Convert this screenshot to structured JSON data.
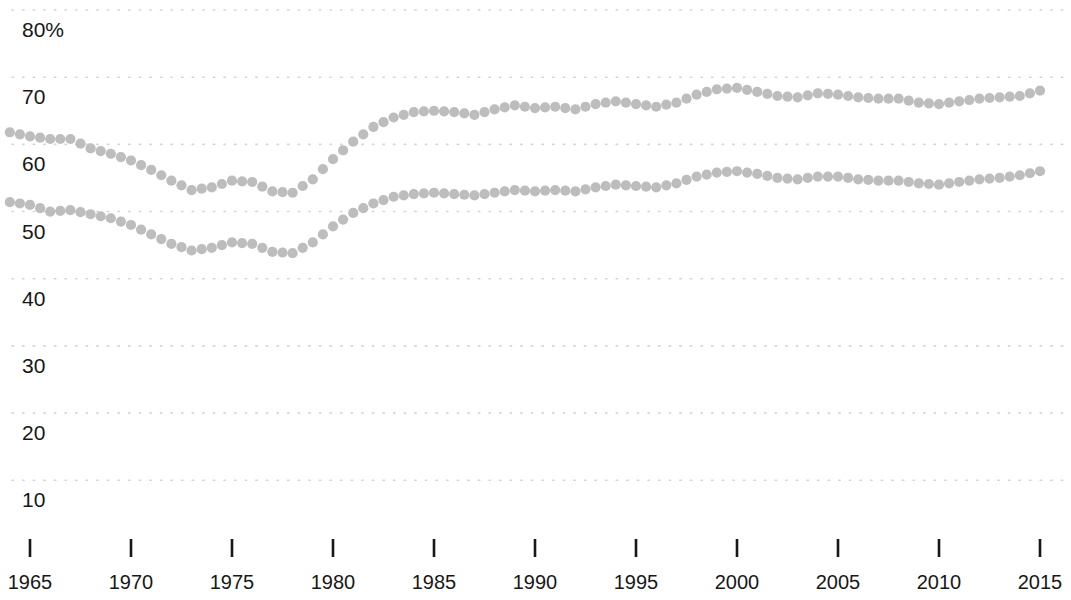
{
  "chart_data": {
    "type": "line",
    "title": "",
    "subtitle": "",
    "xlabel": "",
    "ylabel": "",
    "marker_style": "dotted",
    "grid": true,
    "grid_axis": "y",
    "legend": "none",
    "series_color": "#bdbdbd",
    "xlim": [
      1964,
      2015.8
    ],
    "ylim": [
      5,
      82
    ],
    "y_ticks": [
      10,
      20,
      30,
      40,
      50,
      60,
      70,
      80
    ],
    "y_tick_labels": [
      "10",
      "20",
      "30",
      "40",
      "50",
      "60",
      "70",
      "80%"
    ],
    "x_ticks": [
      1965,
      1970,
      1975,
      1980,
      1985,
      1990,
      1995,
      2000,
      2005,
      2010,
      2015
    ],
    "x_tick_labels": [
      "1965",
      "1970",
      "1975",
      "1980",
      "1985",
      "1990",
      "1995",
      "2000",
      "2005",
      "2010",
      "2015"
    ],
    "x": [
      1964,
      1965,
      1966,
      1967,
      1968,
      1969,
      1970,
      1971,
      1972,
      1973,
      1974,
      1975,
      1976,
      1977,
      1978,
      1979,
      1980,
      1981,
      1982,
      1983,
      1984,
      1985,
      1986,
      1987,
      1988,
      1989,
      1990,
      1991,
      1992,
      1993,
      1994,
      1995,
      1996,
      1997,
      1998,
      1999,
      2000,
      2001,
      2002,
      2003,
      2004,
      2005,
      2006,
      2007,
      2008,
      2009,
      2010,
      2011,
      2012,
      2013,
      2014,
      2015
    ],
    "series": [
      {
        "name": "upper-series",
        "color": "#bdbdbd",
        "values": [
          61.8,
          61.2,
          60.8,
          60.8,
          59.4,
          58.6,
          57.6,
          56.2,
          54.6,
          53.2,
          53.6,
          54.6,
          54.4,
          53.0,
          52.8,
          54.8,
          57.8,
          60.4,
          62.6,
          64.0,
          64.8,
          65.0,
          64.8,
          64.4,
          65.2,
          65.8,
          65.4,
          65.6,
          65.2,
          66.0,
          66.4,
          66.0,
          65.6,
          66.2,
          67.4,
          68.2,
          68.4,
          67.8,
          67.2,
          67.0,
          67.6,
          67.4,
          67.0,
          66.8,
          66.8,
          66.2,
          66.0,
          66.4,
          66.8,
          67.0,
          67.2,
          68.0
        ]
      },
      {
        "name": "lower-series",
        "color": "#bdbdbd",
        "values": [
          51.4,
          51.0,
          50.0,
          50.2,
          49.6,
          49.0,
          48.0,
          46.6,
          45.2,
          44.2,
          44.6,
          45.4,
          45.2,
          44.0,
          43.8,
          45.4,
          47.8,
          49.8,
          51.2,
          52.2,
          52.6,
          52.8,
          52.6,
          52.4,
          52.8,
          53.2,
          53.0,
          53.2,
          53.0,
          53.6,
          54.0,
          53.8,
          53.6,
          54.2,
          55.2,
          55.8,
          56.0,
          55.6,
          55.0,
          54.8,
          55.2,
          55.2,
          54.8,
          54.6,
          54.6,
          54.2,
          54.0,
          54.4,
          54.8,
          55.0,
          55.4,
          56.0
        ]
      }
    ]
  }
}
